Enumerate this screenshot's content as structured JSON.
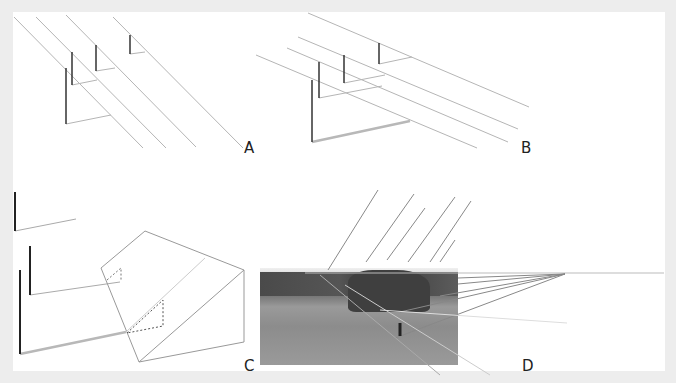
{
  "figure": {
    "panels": [
      {
        "id": "A",
        "label": "A",
        "description": "Parallel receding lines with vertical posts and horizontal connectors"
      },
      {
        "id": "B",
        "label": "B",
        "description": "Parallel lines at shallower angle with posts and base line"
      },
      {
        "id": "C",
        "label": "C",
        "description": "Posts with base lines projected onto inclined plane with dotted right-triangles"
      },
      {
        "id": "D",
        "label": "D",
        "description": "Photograph of field with overlaid perspective lines converging to vanishing point on horizon"
      }
    ],
    "colors": {
      "background": "#ededed",
      "panel": "#ffffff",
      "line": "#aaaaaa",
      "post": "#333333"
    }
  }
}
